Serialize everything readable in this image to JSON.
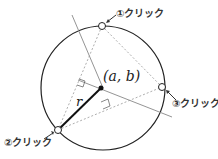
{
  "diagram": {
    "center_label": "(a, b)",
    "radius_label": "r",
    "points": [
      {
        "id": 1,
        "label": "①クリック"
      },
      {
        "id": 2,
        "label": "②クリック"
      },
      {
        "id": 3,
        "label": "③クリック"
      }
    ],
    "colors": {
      "circle": "#222222",
      "radius": "#111111",
      "bisector": "#888888",
      "chord": "#999999"
    }
  }
}
